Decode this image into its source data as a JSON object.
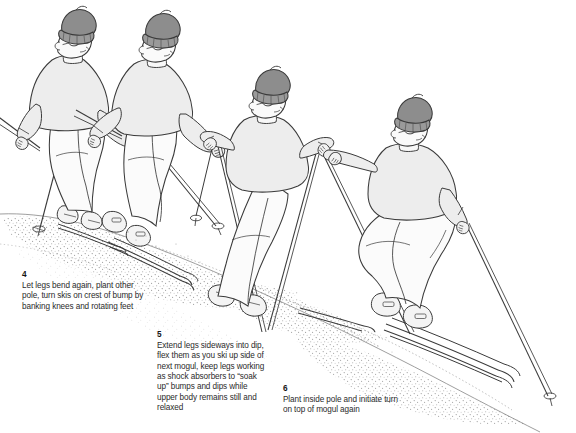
{
  "illustration": {
    "title": "Skiing moguls technique sequence",
    "subject": "four skiers descending a mogul slope",
    "palette": {
      "background": "#ffffff",
      "outline": "#3a3a3a",
      "hat_gray": "#8d8d8d",
      "sweater_gray": "#ededed",
      "pants_white": "#fbfbfb",
      "slope_stipple": "#8a8a8a",
      "caption_text": "#2b2b2b"
    },
    "figures": [
      {
        "id": "skier-1",
        "position": "far-left",
        "pose": "crouched, knees bent, pole planted to the left",
        "hat": "gray knit beanie",
        "glasses": "goggle-style spectacles",
        "sweater": "light gray crewneck",
        "pants": "white ski pants",
        "skis": 2,
        "poles": 2
      },
      {
        "id": "skier-2",
        "position": "left-center",
        "pose": "compressed over bump crest, skis turning",
        "hat": "gray knit beanie",
        "glasses": "goggle-style spectacles",
        "sweater": "light gray crewneck",
        "pants": "white ski pants",
        "skis": 2,
        "poles": 2
      },
      {
        "id": "skier-3",
        "position": "center-right",
        "pose": "legs extended into dip, upright torso",
        "hat": "gray knit beanie",
        "glasses": "goggle-style spectacles",
        "sweater": "light gray crewneck",
        "pants": "white ski pants",
        "skis": 2,
        "poles": 2
      },
      {
        "id": "skier-4",
        "position": "far-right",
        "pose": "planting inside pole on top of mogul, deep knee bend",
        "hat": "gray knit beanie",
        "glasses": "goggle-style spectacles",
        "sweater": "light gray crewneck",
        "pants": "white ski pants",
        "skis": 2,
        "poles": 2
      }
    ],
    "slope": {
      "description": "diagonal mogul slope descending left-to-right with stippled shading on the bump faces",
      "shading": "dot stipple"
    }
  },
  "captions": [
    {
      "id": "caption-4",
      "number": "4",
      "text": "Let legs bend again, plant other pole, turn skis on crest of bump by banking knees and rotating feet"
    },
    {
      "id": "caption-5",
      "number": "5",
      "text": "Extend legs sideways into dip, flex them as you ski up side of next mogul, keep legs working as shock absorbers to “soak up” bumps and dips while upper body remains still and relaxed"
    },
    {
      "id": "caption-6",
      "number": "6",
      "text": "Plant inside pole and initiate turn on top of mogul again"
    }
  ]
}
